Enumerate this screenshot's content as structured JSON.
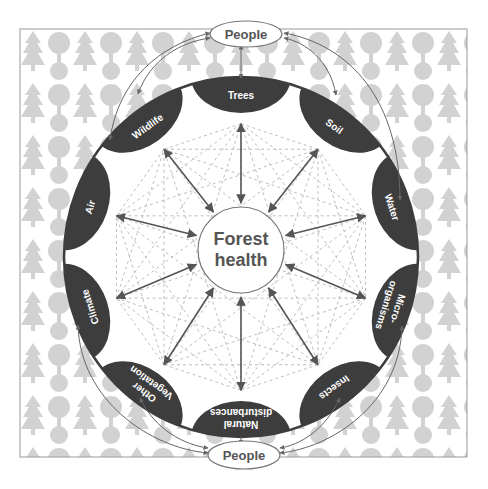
{
  "diagram": {
    "center": {
      "line1": "Forest",
      "line2": "health"
    },
    "people_top": "People",
    "people_bottom": "People",
    "components": [
      {
        "id": "trees",
        "line1": "Trees",
        "line2": ""
      },
      {
        "id": "soil",
        "line1": "Soil",
        "line2": ""
      },
      {
        "id": "water",
        "line1": "Water",
        "line2": ""
      },
      {
        "id": "microorganisms",
        "line1": "Micro-",
        "line2": "organisms"
      },
      {
        "id": "insects",
        "line1": "Insects",
        "line2": ""
      },
      {
        "id": "natural-disturbances",
        "line1": "Natural",
        "line2": "disturbances"
      },
      {
        "id": "other-vegetation",
        "line1": "Other",
        "line2": "Vegetation"
      },
      {
        "id": "climate",
        "line1": "Climate",
        "line2": ""
      },
      {
        "id": "air",
        "line1": "Air",
        "line2": ""
      },
      {
        "id": "wildlife",
        "line1": "Wildlife",
        "line2": ""
      }
    ],
    "colors": {
      "node_fill": "#3d3d3d",
      "background_pattern": "#cfcfcf",
      "arrow": "#555555",
      "dashed_web": "#bdbdbd"
    }
  }
}
